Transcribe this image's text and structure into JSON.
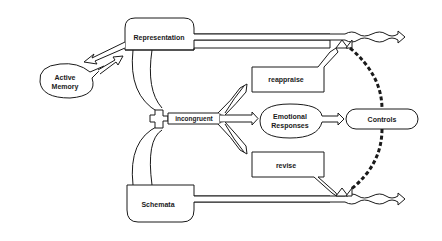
{
  "diagram": {
    "nodes": {
      "representation": "Representation",
      "active_memory_line1": "Active",
      "active_memory_line2": "Memory",
      "schemata": "Schemata",
      "incongruent": "incongruent",
      "reappraise": "reappraise",
      "emotional_line1": "Emotional",
      "emotional_line2": "Responses",
      "revise": "revise",
      "controls": "Controls"
    },
    "colors": {
      "stroke": "#1a1a1a",
      "background": "#ffffff"
    },
    "edges": [
      {
        "from": "Active Memory",
        "to": "Representation",
        "style": "double-arrow bidirectional"
      },
      {
        "from": "Representation",
        "to": "incongruent",
        "style": "double-line curved"
      },
      {
        "from": "Schemata",
        "to": "incongruent",
        "style": "double-line curved"
      },
      {
        "from": "incongruent",
        "to": "reappraise",
        "style": "double-arrow"
      },
      {
        "from": "incongruent",
        "to": "Emotional Responses",
        "style": "double-arrow"
      },
      {
        "from": "incongruent",
        "to": "revise",
        "style": "double-arrow"
      },
      {
        "from": "Emotional Responses",
        "to": "Controls",
        "style": "double-arrow"
      },
      {
        "from": "reappraise",
        "to": "Representation output",
        "style": "double-arrow"
      },
      {
        "from": "revise",
        "to": "Schemata output",
        "style": "double-arrow"
      },
      {
        "from": "Controls",
        "to": "upper gate",
        "style": "dashed-thick"
      },
      {
        "from": "Controls",
        "to": "lower gate",
        "style": "dashed-thick"
      },
      {
        "from": "Representation",
        "to": "output (wavy)",
        "style": "double-line wavy arrow"
      },
      {
        "from": "Schemata",
        "to": "output (wavy)",
        "style": "double-line wavy arrow"
      }
    ]
  }
}
